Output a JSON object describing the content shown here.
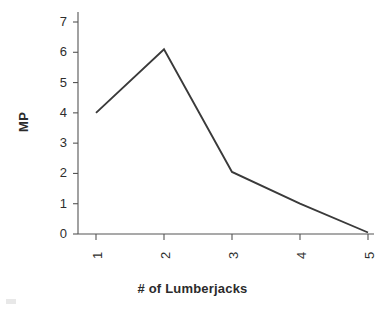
{
  "chart_data": {
    "type": "line",
    "title": "",
    "xlabel": "# of Lumberjacks",
    "ylabel": "MP",
    "x": [
      1,
      2,
      3,
      4,
      5
    ],
    "values": [
      4.0,
      6.1,
      2.05,
      1.0,
      0.05
    ],
    "categories": [
      "1",
      "2",
      "3",
      "4",
      "5"
    ],
    "xtick_labels": [
      "1",
      "2",
      "3",
      "4",
      "5"
    ],
    "ytick_labels": [
      "0",
      "1",
      "2",
      "3",
      "4",
      "5",
      "6",
      "7"
    ],
    "ytick_values": [
      0,
      1,
      2,
      3,
      4,
      5,
      6,
      7
    ],
    "xlim": [
      0.7,
      5.1
    ],
    "ylim": [
      0,
      7.3
    ],
    "grid": false,
    "legend": null,
    "series": [
      {
        "name": "MP",
        "values": [
          4.0,
          6.1,
          2.05,
          1.0,
          0.05
        ]
      }
    ],
    "line_color": "#3a3a3a",
    "background_color": "#ffffff",
    "axis_color": "#555555",
    "text_color": "#2e2e2e"
  }
}
